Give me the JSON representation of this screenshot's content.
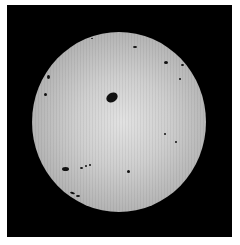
{
  "image": {
    "subject": "Sun with sunspots",
    "colors": {
      "background": "#000000",
      "margin": "#ffffff",
      "disk_center": "#e2e2e2",
      "disk_edge": "#9a9a9a",
      "sunspot": "#111111"
    },
    "sunspots": [
      {
        "id": "large-central",
        "x": 112,
        "y": 97,
        "w": 12,
        "h": 9,
        "rotate": -30
      },
      {
        "id": "lower-left",
        "x": 65,
        "y": 169,
        "w": 7,
        "h": 4,
        "rotate": 0
      },
      {
        "id": "lower-left-group-1",
        "x": 81,
        "y": 168,
        "w": 3,
        "h": 2,
        "rotate": 0
      },
      {
        "id": "lower-left-group-2",
        "x": 86,
        "y": 166,
        "w": 2,
        "h": 2,
        "rotate": 0
      },
      {
        "id": "lower-left-group-3",
        "x": 90,
        "y": 165,
        "w": 2,
        "h": 2,
        "rotate": 0
      },
      {
        "id": "lower-left-edge-1",
        "x": 72,
        "y": 193,
        "w": 5,
        "h": 2,
        "rotate": 20
      },
      {
        "id": "lower-left-edge-2",
        "x": 78,
        "y": 196,
        "w": 4,
        "h": 2,
        "rotate": 0
      },
      {
        "id": "lower-center",
        "x": 128,
        "y": 171,
        "w": 3,
        "h": 3,
        "rotate": 0
      },
      {
        "id": "upper-right-1",
        "x": 166,
        "y": 62,
        "w": 4,
        "h": 3,
        "rotate": 0
      },
      {
        "id": "upper-right-2",
        "x": 135,
        "y": 47,
        "w": 4,
        "h": 2,
        "rotate": 0
      },
      {
        "id": "right-edge",
        "x": 182,
        "y": 65,
        "w": 3,
        "h": 2,
        "rotate": 0
      },
      {
        "id": "right-1",
        "x": 180,
        "y": 79,
        "w": 2,
        "h": 2,
        "rotate": 0
      },
      {
        "id": "right-mid",
        "x": 165,
        "y": 134,
        "w": 2,
        "h": 2,
        "rotate": 0
      },
      {
        "id": "right-mid-2",
        "x": 176,
        "y": 142,
        "w": 2,
        "h": 2,
        "rotate": 0
      },
      {
        "id": "left-upper-1",
        "x": 48,
        "y": 77,
        "w": 3,
        "h": 4,
        "rotate": 0
      },
      {
        "id": "left-upper-2",
        "x": 45,
        "y": 94,
        "w": 3,
        "h": 3,
        "rotate": 0
      },
      {
        "id": "top-1",
        "x": 92,
        "y": 38,
        "w": 2,
        "h": 1,
        "rotate": 0
      }
    ]
  }
}
